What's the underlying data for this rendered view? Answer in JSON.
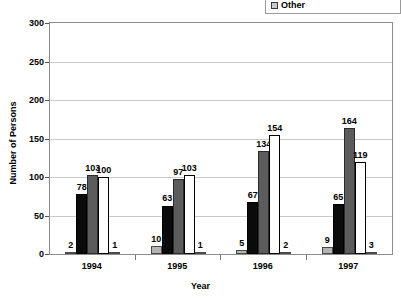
{
  "legend": {
    "entries": [
      {
        "label": "Other",
        "swatch_color": "#c8c8c8"
      }
    ]
  },
  "chart_data": {
    "type": "bar",
    "title": "",
    "xlabel": "Year",
    "ylabel": "Number of Persons",
    "categories": [
      "1994",
      "1995",
      "1996",
      "1997"
    ],
    "yticks": [
      "0",
      "50",
      "100",
      "150",
      "200",
      "250",
      "300"
    ],
    "ylim": [
      0,
      300
    ],
    "grid": true,
    "legend_position": "top-right",
    "series": [
      {
        "name": "Series 1",
        "color": "#b4b4b4",
        "values": [
          2,
          10,
          5,
          9
        ]
      },
      {
        "name": "Series 2",
        "color": "#0b0b0b",
        "values": [
          78,
          63,
          67,
          65
        ]
      },
      {
        "name": "Series 3",
        "color": "#5c5c5c",
        "values": [
          103,
          97,
          134,
          164
        ]
      },
      {
        "name": "Series 4",
        "color": "#ffffff",
        "values": [
          100,
          103,
          154,
          119
        ]
      },
      {
        "name": "Other",
        "color": "#b4b4b4",
        "values": [
          1,
          1,
          2,
          3
        ]
      }
    ],
    "value_labels": {
      "1994": [
        "2",
        "78",
        "103",
        "100",
        "1"
      ],
      "1995": [
        "10",
        "63",
        "97",
        "103",
        "1"
      ],
      "1996": [
        "5",
        "67",
        "134",
        "154",
        "2"
      ],
      "1997": [
        "9",
        "65",
        "164",
        "119",
        "3"
      ]
    }
  }
}
